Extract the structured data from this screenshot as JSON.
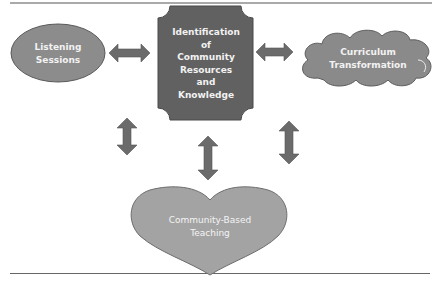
{
  "diagram": {
    "nodes": [
      {
        "id": "listening",
        "shape": "ellipse",
        "label_lines": [
          "Listening",
          "Sessions"
        ]
      },
      {
        "id": "identification",
        "shape": "plaque",
        "label_lines": [
          "Identification",
          "of",
          "Community",
          "Resources",
          "and",
          "Knowledge"
        ]
      },
      {
        "id": "curriculum",
        "shape": "cloud",
        "label_lines": [
          "Curriculum",
          "Transformation"
        ]
      },
      {
        "id": "teaching",
        "shape": "heart",
        "label_lines": [
          "Community-Based",
          "Teaching"
        ]
      }
    ],
    "edges": [
      {
        "from": "listening",
        "to": "identification",
        "type": "double-arrow-horizontal"
      },
      {
        "from": "identification",
        "to": "curriculum",
        "type": "double-arrow-horizontal"
      },
      {
        "from": "listening",
        "to": "teaching",
        "type": "double-arrow-vertical"
      },
      {
        "from": "identification",
        "to": "teaching",
        "type": "double-arrow-vertical"
      },
      {
        "from": "curriculum",
        "to": "teaching",
        "type": "double-arrow-vertical"
      }
    ],
    "colors": {
      "ellipse": "#8c8c8c",
      "plaque": "#616161",
      "cloud": "#8a8a8a",
      "heart": "#a3a3a3",
      "arrow": "#6b6b6b",
      "rule": "#555555"
    }
  }
}
